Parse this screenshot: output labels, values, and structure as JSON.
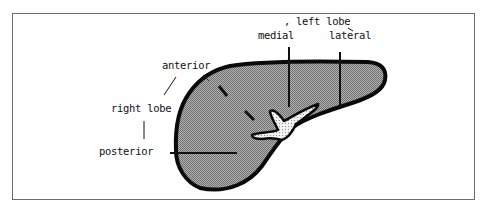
{
  "diagram": {
    "colors": {
      "outline": "#0a0a0a",
      "fill": "#9c9c9c",
      "hilum_fill": "#e6e6e6",
      "frame": "#6b6b6b",
      "text": "#111111"
    },
    "labels": {
      "left_lobe": ", left lobe",
      "medial": "medial",
      "lateral": "lateral",
      "anterior": "anterior",
      "right_lobe": "right lobe",
      "posterior": "posterior"
    }
  }
}
